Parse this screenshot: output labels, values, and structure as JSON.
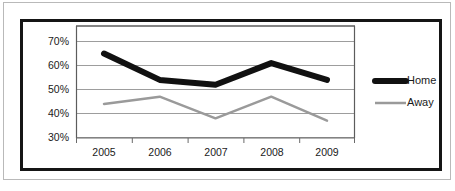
{
  "chart_data": {
    "type": "line",
    "title": "",
    "xlabel": "",
    "ylabel": "",
    "x": [
      "2005",
      "2006",
      "2007",
      "2008",
      "2009"
    ],
    "categories": [
      "2005",
      "2006",
      "2007",
      "2008",
      "2009"
    ],
    "series": [
      {
        "name": "Home",
        "values": [
          65,
          54,
          52,
          61,
          54
        ],
        "color": "#111111",
        "width": 6
      },
      {
        "name": "Away",
        "values": [
          44,
          47,
          38,
          47,
          37
        ],
        "color": "#9a9a9a",
        "width": 2.5
      }
    ],
    "ylim": [
      30,
      70
    ],
    "yticks": [
      30,
      40,
      50,
      60,
      70
    ],
    "ytick_labels": [
      "30%",
      "40%",
      "50%",
      "60%",
      "70%"
    ],
    "xtick_labels": [
      "2005",
      "2006",
      "2007",
      "2008",
      "2009"
    ],
    "grid": true,
    "grid_color": "#9d9d9d",
    "legend_position": "right",
    "legend": [
      {
        "label": "Home",
        "color": "#111111",
        "width": 6
      },
      {
        "label": "Away",
        "color": "#9a9a9a",
        "width": 2.5
      }
    ]
  },
  "frame": {
    "outer_border_color": "#b9b9b9",
    "inner_border_color": "#151515",
    "background": "#ffffff"
  }
}
